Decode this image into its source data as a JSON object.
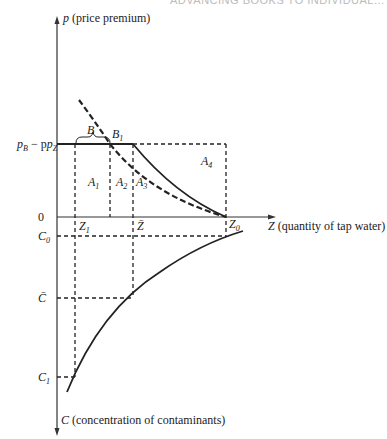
{
  "header": {
    "running_title": "ADVANCING BOOKS TO INDIVIDUAL..."
  },
  "axes": {
    "y_top": {
      "symbol": "p",
      "label": "(price premium)"
    },
    "x": {
      "symbol": "Z",
      "label": "(quantity of tap water)"
    },
    "y_bottom": {
      "symbol": "C",
      "label": "(concentration of contaminants)"
    }
  },
  "levels": {
    "price_diff": "p",
    "price_diff_sub_b": "B",
    "price_diff_minus": " − p",
    "price_diff_sub_z": "Z",
    "origin": "0",
    "c0": "C",
    "c0_sub": "0",
    "cbar": "C̄",
    "c1": "C",
    "c1_sub": "1"
  },
  "quantities": {
    "z1": "Z",
    "z1_sub": "1",
    "zbar": "Z̄",
    "z0": "Z",
    "z0_sub": "0"
  },
  "points": {
    "b": "B",
    "b1": "B",
    "b1_sub": "1"
  },
  "areas": [
    {
      "label": "A",
      "sub": "1"
    },
    {
      "label": "A",
      "sub": "2"
    },
    {
      "label": "A",
      "sub": "3"
    },
    {
      "label": "A",
      "sub": "4"
    }
  ]
}
